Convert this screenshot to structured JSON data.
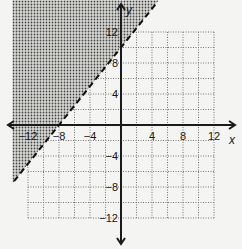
{
  "chart_data": {
    "type": "inequality-graph",
    "title": "",
    "xlabel": "x",
    "ylabel": "y",
    "xlim": [
      -14,
      14
    ],
    "ylim": [
      -14,
      14
    ],
    "grid": true,
    "grid_step": 2,
    "grid_range": {
      "x": [
        -12,
        12
      ],
      "y": [
        -12,
        12
      ]
    },
    "x_ticks": [
      -12,
      -8,
      -4,
      4,
      8,
      12
    ],
    "y_ticks": [
      12,
      8,
      4,
      -4,
      -8,
      -12
    ],
    "x_tick_labels": [
      "−12",
      "−8",
      "−4",
      "4",
      "8",
      "12"
    ],
    "y_tick_labels": [
      "12",
      "8",
      "4",
      "−4",
      "−8",
      "−12"
    ],
    "boundary": {
      "equation": "y = (5/4)x + 10",
      "slope": 1.25,
      "intercept": 10,
      "points": [
        [
          -8,
          0
        ],
        [
          0,
          10
        ]
      ],
      "style": "dashed"
    },
    "inequality": "y > (5/4)x + 10",
    "shaded_region": "above-left of boundary",
    "colors": {
      "shade": "#555555",
      "axis": "#1a1a1a",
      "grid": "#777777",
      "background": "#f4f4f2"
    }
  }
}
